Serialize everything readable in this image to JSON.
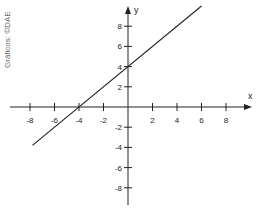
{
  "credit": "Gráficos: ©DAE",
  "chart_data": {
    "type": "line",
    "title": "",
    "xlabel": "x",
    "ylabel": "y",
    "xlim": [
      -9.5,
      9.5
    ],
    "ylim": [
      -9.5,
      9.5
    ],
    "grid": false,
    "x_ticks": [
      -8,
      -6,
      -4,
      -2,
      2,
      4,
      6,
      8
    ],
    "y_ticks": [
      -8,
      -6,
      -4,
      -2,
      2,
      4,
      6,
      8
    ],
    "x_tick_labels": [
      "-8",
      "-6",
      "-4",
      "-2",
      "2",
      "4",
      "6",
      "8"
    ],
    "y_tick_labels": [
      "-8",
      "-6",
      "-4",
      "-2",
      "2",
      "4",
      "6",
      "8"
    ],
    "series": [
      {
        "name": "y = x + 4",
        "x": [
          -7.8,
          6.0
        ],
        "y": [
          -3.8,
          10.0
        ]
      }
    ],
    "points": [
      {
        "x": -4,
        "y": 0
      },
      {
        "x": 0,
        "y": 4
      }
    ]
  }
}
